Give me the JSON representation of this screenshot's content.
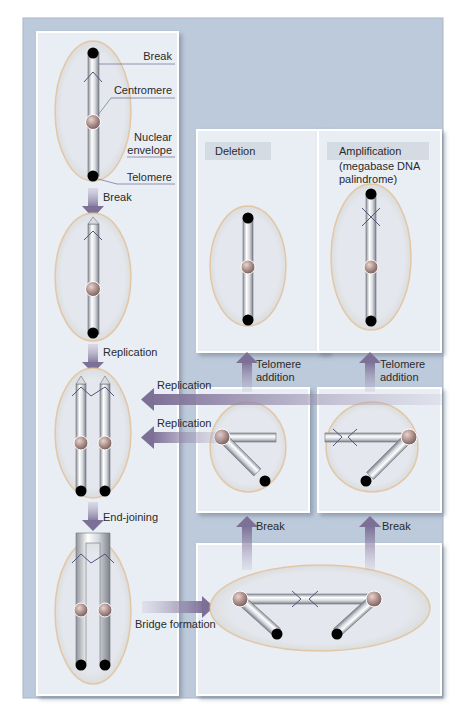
{
  "figure": {
    "colors": {
      "background": "#bccadb",
      "panel": "#e9eef5",
      "panel_border": "#ffffff",
      "ellipse_fill": "#dfe4ea",
      "ellipse_stroke": "#e2b98a",
      "arrow": "#8b7fa3",
      "chromosome": "#c9ccd3",
      "chromosome_highlight": "#ffffff",
      "centromere": "#b79a96",
      "telomere": "#000000",
      "leader_line": "#7a7a9a"
    },
    "labels": {
      "break_top": "Break",
      "centromere": "Centromere",
      "nuclear_envelope_1": "Nuclear",
      "nuclear_envelope_2": "envelope",
      "telomere": "Telomere",
      "break_arrow": "Break",
      "replication_arrow": "Replication",
      "end_joining": "End-joining",
      "bridge_formation": "Bridge formation",
      "replication_h1": "Replication",
      "replication_h2": "Replication",
      "deletion": "Deletion",
      "amplification": "Amplification",
      "amplification_sub1": "(megabase DNA",
      "amplification_sub2": "palindrome)",
      "telomere_addition_left_1": "Telomere",
      "telomere_addition_left_2": "addition",
      "telomere_addition_right_1": "Telomere",
      "telomere_addition_right_2": "addition",
      "break_left": "Break",
      "break_right": "Break"
    },
    "panels": [
      {
        "id": "intact-chromosome-panel",
        "stage": "Intact chromosome with labels"
      },
      {
        "id": "deletion-panel",
        "stage": "Deletion"
      },
      {
        "id": "amplification-panel",
        "stage": "Amplification (megabase DNA palindrome)"
      },
      {
        "id": "broken-left-panel",
        "stage": "Broken dicentric fragment (left)"
      },
      {
        "id": "broken-right-panel",
        "stage": "Broken dicentric fragment (right)"
      },
      {
        "id": "bridge-panel",
        "stage": "Anaphase bridge"
      }
    ]
  }
}
